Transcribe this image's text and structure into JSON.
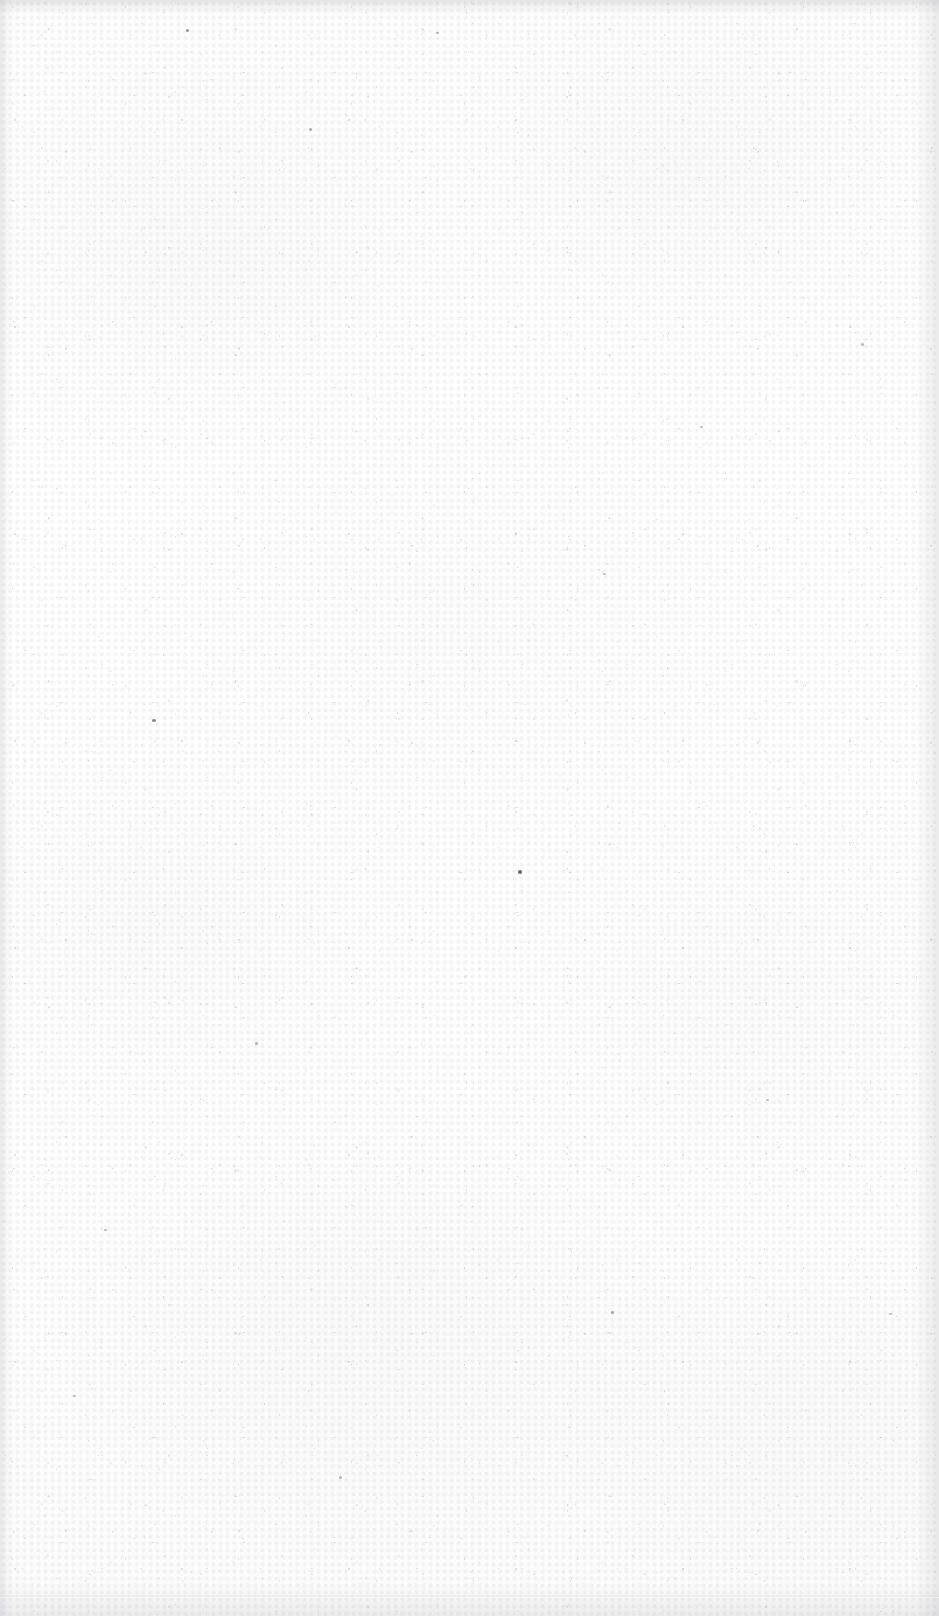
{
  "document": {
    "kind": "scanned-blank-page",
    "page_label": "",
    "body_text": "",
    "header_text": "",
    "footer_text": "",
    "page_number": ""
  },
  "canvas": {
    "width_px": 939,
    "height_px": 1616
  },
  "colors": {
    "paper": "#fdfdfd",
    "paper_light": "#fefefe",
    "paper_shade": "#fbfbfb",
    "grain": "#78787f",
    "edge_shadow": "#929298",
    "speck": "#4a4a50"
  },
  "artifacts": {
    "top_edge_band": true,
    "left_edge_band": true,
    "right_edge_band": true,
    "bottom_edge_band": true,
    "bottom_crease_line": true
  },
  "specks": [
    {
      "x": 518,
      "y": 870,
      "w": 4,
      "h": 4,
      "opacity": 0.8
    },
    {
      "x": 152,
      "y": 719,
      "w": 4,
      "h": 3,
      "opacity": 0.62
    },
    {
      "x": 186,
      "y": 29,
      "w": 3,
      "h": 3,
      "opacity": 0.5
    },
    {
      "x": 436,
      "y": 32,
      "w": 3,
      "h": 2,
      "opacity": 0.42
    },
    {
      "x": 309,
      "y": 128,
      "w": 3,
      "h": 3,
      "opacity": 0.4
    },
    {
      "x": 700,
      "y": 426,
      "w": 3,
      "h": 2,
      "opacity": 0.38
    },
    {
      "x": 861,
      "y": 343,
      "w": 3,
      "h": 3,
      "opacity": 0.36
    },
    {
      "x": 603,
      "y": 573,
      "w": 3,
      "h": 2,
      "opacity": 0.34
    },
    {
      "x": 255,
      "y": 1042,
      "w": 3,
      "h": 3,
      "opacity": 0.4
    },
    {
      "x": 766,
      "y": 1099,
      "w": 3,
      "h": 2,
      "opacity": 0.36
    },
    {
      "x": 611,
      "y": 1311,
      "w": 3,
      "h": 3,
      "opacity": 0.42
    },
    {
      "x": 889,
      "y": 1313,
      "w": 3,
      "h": 2,
      "opacity": 0.34
    },
    {
      "x": 104,
      "y": 1229,
      "w": 3,
      "h": 2,
      "opacity": 0.38
    },
    {
      "x": 339,
      "y": 1476,
      "w": 3,
      "h": 3,
      "opacity": 0.36
    },
    {
      "x": 73,
      "y": 1395,
      "w": 3,
      "h": 2,
      "opacity": 0.34
    }
  ]
}
